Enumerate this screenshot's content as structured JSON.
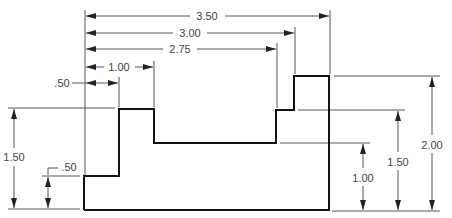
{
  "drawing": {
    "type": "dimensioned stepped profile",
    "part_outline_points": [
      [
        84,
        210
      ],
      [
        84,
        176
      ],
      [
        119,
        176
      ],
      [
        119,
        109
      ],
      [
        154,
        109
      ],
      [
        154,
        143
      ],
      [
        276,
        143
      ],
      [
        276,
        110
      ],
      [
        294,
        110
      ],
      [
        294,
        76
      ],
      [
        329,
        76
      ],
      [
        329,
        210
      ]
    ],
    "colors": {
      "outline": "#111111",
      "dimension": "#555555",
      "text": "#444444",
      "background": "#ffffff"
    }
  },
  "dimensions": {
    "horizontal": [
      {
        "label": "3.50",
        "y": 16,
        "x1": 85,
        "x2": 330,
        "text_x": 207
      },
      {
        "label": "3.00",
        "y": 33,
        "x1": 85,
        "x2": 295,
        "text_x": 190
      },
      {
        "label": "2.75",
        "y": 49,
        "x1": 85,
        "x2": 277,
        "text_x": 180
      },
      {
        "label": "1.00",
        "y": 67,
        "x1": 85,
        "x2": 154,
        "text_x": 119
      },
      {
        "label": ".50",
        "y": 83,
        "x1": 85,
        "x2": 119,
        "text_x": 62
      }
    ],
    "vertical_left": [
      {
        "label": "1.50",
        "x": 14,
        "y1": 109,
        "y2": 209
      },
      {
        "label": ".50",
        "x": 48,
        "y1": 176,
        "y2": 209
      }
    ],
    "vertical_right": [
      {
        "label": "1.00",
        "x": 363,
        "y1": 143,
        "y2": 211
      },
      {
        "label": "1.50",
        "x": 398,
        "y1": 110,
        "y2": 211
      },
      {
        "label": "2.00",
        "x": 432,
        "y1": 76,
        "y2": 211
      }
    ]
  },
  "labels": {
    "top_350": "3.50",
    "top_300": "3.00",
    "top_275": "2.75",
    "top_100": "1.00",
    "top_050": ".50",
    "left_150": "1.50",
    "left_050": ".50",
    "right_100": "1.00",
    "right_150": "1.50",
    "right_200": "2.00"
  }
}
